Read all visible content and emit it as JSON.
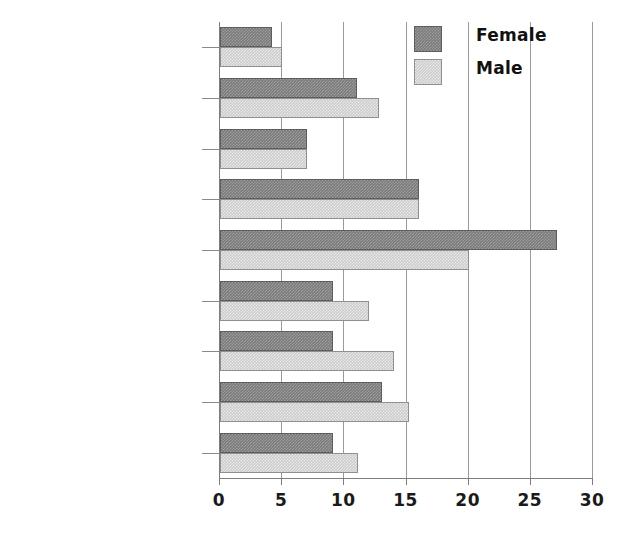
{
  "chart_data": {
    "type": "bar",
    "orientation": "horizontal",
    "title": "",
    "subtitle": "",
    "xlabel": "",
    "ylabel": "",
    "xlim": [
      0,
      30
    ],
    "xticks": [
      0,
      5,
      10,
      15,
      20,
      25,
      30
    ],
    "xtick_labels": [
      "0",
      "5",
      "10",
      "15",
      "20",
      "25",
      "30"
    ],
    "grid": true,
    "grid_axis": "x",
    "legend_position": "top-right",
    "categories": [
      "White",
      "Mixed",
      "Indian",
      "Pakistani",
      "Bangladeshi",
      "Other Asian",
      "Black Caribbean",
      "Black African",
      "Other"
    ],
    "series": [
      {
        "name": "Female",
        "color": "#7c7c7c",
        "values": [
          4.2,
          11.0,
          7.0,
          16.0,
          27.1,
          9.1,
          9.1,
          13.0,
          9.1
        ]
      },
      {
        "name": "Male",
        "color": "#cccccc",
        "values": [
          5.0,
          12.8,
          7.0,
          16.0,
          20.0,
          12.0,
          14.0,
          15.2,
          11.1
        ]
      }
    ]
  },
  "legend": {
    "entries": [
      {
        "label": "Female",
        "swatch": "female-swatch"
      },
      {
        "label": "Male",
        "swatch": "male-swatch"
      }
    ]
  }
}
